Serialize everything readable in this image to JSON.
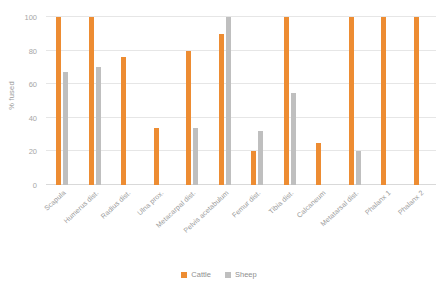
{
  "chart_data": {
    "type": "bar",
    "title": "",
    "xlabel": "",
    "ylabel": "% fused",
    "ylim": [
      0,
      100
    ],
    "yticks": [
      0,
      20,
      40,
      60,
      80,
      100
    ],
    "grid": true,
    "legend_position": "bottom",
    "categories": [
      "Scapula",
      "Humerus dist.",
      "Radius dist.",
      "Ulna prox.",
      "Metacarpal dist.",
      "Pelvis acetabulum",
      "Femur dist.",
      "Tibia dist.",
      "Calcaneum",
      "Metatarsal dist.",
      "Phalanx 1",
      "Phalanx 2"
    ],
    "series": [
      {
        "name": "Cattle",
        "color": "#ed8c32",
        "values": [
          100,
          100,
          76,
          34,
          80,
          90,
          20,
          100,
          25,
          100,
          100,
          100
        ]
      },
      {
        "name": "Sheep",
        "color": "#bfbfbf",
        "values": [
          67,
          70,
          null,
          null,
          34,
          100,
          32,
          55,
          null,
          20,
          null,
          null
        ]
      }
    ]
  },
  "axis": {
    "y_title": "% fused",
    "y_tick_labels": [
      "0",
      "20",
      "40",
      "60",
      "80",
      "100"
    ]
  },
  "legend": {
    "items": [
      {
        "label": "Cattle",
        "color": "#ed8c32",
        "swatch_name": "legend-swatch-cattle"
      },
      {
        "label": "Sheep",
        "color": "#bfbfbf",
        "swatch_name": "legend-swatch-sheep"
      }
    ]
  }
}
